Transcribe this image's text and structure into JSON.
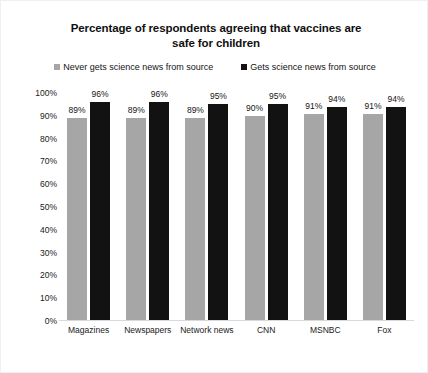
{
  "chart_data": {
    "type": "bar",
    "title": "Percentage of respondents agreeing that vaccines are safe for children",
    "title_line1": "Percentage of respondents agreeing that vaccines are",
    "title_line2": "safe for children",
    "xlabel": "",
    "ylabel": "",
    "ylim": [
      0,
      100
    ],
    "grid": false,
    "legend_position": "top",
    "value_suffix": "%",
    "categories": [
      "Magazines",
      "Newspapers",
      "Network news",
      "CNN",
      "MSNBC",
      "Fox"
    ],
    "series": [
      {
        "name": "Never gets science news from source",
        "color": "#a6a6a6",
        "values": [
          89,
          89,
          89,
          90,
          91,
          91
        ],
        "labels": [
          "89%",
          "89%",
          "89%",
          "90%",
          "91%",
          "91%"
        ]
      },
      {
        "name": "Gets science news from source",
        "color": "#121212",
        "values": [
          96,
          96,
          95,
          95,
          94,
          94
        ],
        "labels": [
          "96%",
          "96%",
          "95%",
          "95%",
          "94%",
          "94%"
        ]
      }
    ],
    "y_ticks": [
      {
        "value": 100,
        "label": "100%"
      },
      {
        "value": 90,
        "label": "90%"
      },
      {
        "value": 80,
        "label": "80%"
      },
      {
        "value": 70,
        "label": "70%"
      },
      {
        "value": 60,
        "label": "60%"
      },
      {
        "value": 50,
        "label": "50%"
      },
      {
        "value": 40,
        "label": "40%"
      },
      {
        "value": 30,
        "label": "30%"
      },
      {
        "value": 20,
        "label": "20%"
      },
      {
        "value": 10,
        "label": "10%"
      },
      {
        "value": 0,
        "label": "0%"
      }
    ]
  }
}
